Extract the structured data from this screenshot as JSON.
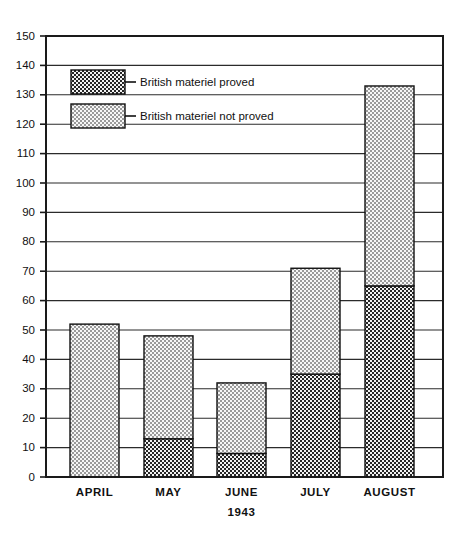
{
  "chart_data": {
    "type": "bar",
    "stacked": true,
    "title": "",
    "subtitle": "",
    "xlabel": "1943",
    "ylabel": "",
    "categories": [
      "APRIL",
      "MAY",
      "JUNE",
      "JULY",
      "AUGUST"
    ],
    "series": [
      {
        "name": "British materiel proved",
        "values": [
          0,
          13,
          8,
          35,
          65
        ],
        "color": "#555555",
        "pattern": "dark-checker"
      },
      {
        "name": "British materiel not proved",
        "values": [
          52,
          35,
          24,
          36,
          68
        ],
        "color": "#cccccc",
        "pattern": "light-checker"
      }
    ],
    "totals": [
      52,
      48,
      32,
      71,
      133
    ],
    "ylim": [
      0,
      150
    ],
    "ytick_step": 10,
    "yticks": [
      0,
      10,
      20,
      30,
      40,
      50,
      60,
      70,
      80,
      90,
      100,
      110,
      120,
      130,
      140,
      150
    ],
    "ytick_labels": [
      "0",
      "10",
      "20",
      "30",
      "40",
      "50",
      "60",
      "70",
      "80",
      "90",
      "100",
      "110",
      "120",
      "130",
      "140",
      "150"
    ],
    "grid": true,
    "grid_axis": "y",
    "legend_position": "inside-top-left",
    "legend": [
      {
        "label": "British materiel proved",
        "swatch": "dark-checker"
      },
      {
        "label": "British materiel not proved",
        "swatch": "light-checker"
      }
    ],
    "annotations": [
      "1943"
    ]
  },
  "colors": {
    "background": "#ffffff",
    "axis": "#1a1a1a",
    "grid": "#2b2b2b",
    "text": "#111111",
    "proved_fill": "#4d4d4d",
    "not_proved_fill": "#d2d2d2"
  }
}
